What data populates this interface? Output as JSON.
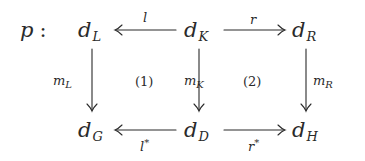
{
  "diagram": {
    "type": "commutative-diagram",
    "title_label": "p",
    "title_separator": ":",
    "nodes": {
      "d_L": {
        "base": "d",
        "sub": "L"
      },
      "d_K": {
        "base": "d",
        "sub": "K"
      },
      "d_R": {
        "base": "d",
        "sub": "R"
      },
      "d_G": {
        "base": "d",
        "sub": "G"
      },
      "d_D": {
        "base": "d",
        "sub": "D"
      },
      "d_H": {
        "base": "d",
        "sub": "H"
      }
    },
    "edges": {
      "l": {
        "base": "l",
        "from": "d_K",
        "to": "d_L"
      },
      "r": {
        "base": "r",
        "from": "d_K",
        "to": "d_R"
      },
      "m_L": {
        "base": "m",
        "sub": "L",
        "from": "d_L",
        "to": "d_G"
      },
      "m_K": {
        "base": "m",
        "sub": "K",
        "from": "d_K",
        "to": "d_D"
      },
      "m_R": {
        "base": "m",
        "sub": "R",
        "from": "d_R",
        "to": "d_H"
      },
      "l_star": {
        "base": "l",
        "sup": "*",
        "from": "d_D",
        "to": "d_G"
      },
      "r_star": {
        "base": "r",
        "sup": "*",
        "from": "d_D",
        "to": "d_H"
      }
    },
    "squares": {
      "left": "(1)",
      "right": "(2)"
    },
    "colors": {
      "ink": "#2a2a2a",
      "background": "#ffffff"
    }
  }
}
